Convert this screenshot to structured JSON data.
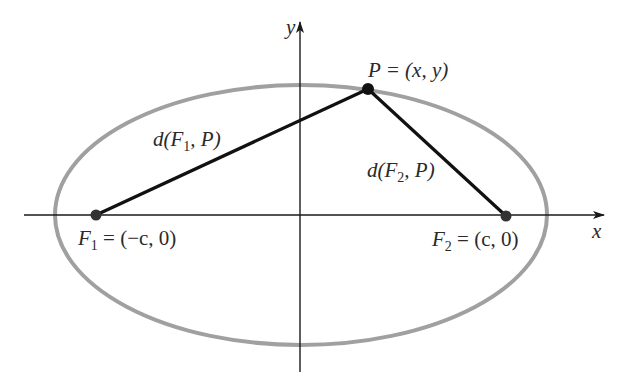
{
  "diagram": {
    "type": "ellipse-foci-distance",
    "colors": {
      "ellipse": "#a0a0a0",
      "axes": "#1a1a1a",
      "segments": "#111111",
      "points": "#333333",
      "text": "#2a2a2a",
      "background": "#ffffff"
    },
    "axes": {
      "x_label": "x",
      "y_label": "y"
    },
    "ellipse": {
      "cx": 301,
      "cy": 215,
      "rx": 246,
      "ry": 130
    },
    "points": {
      "F1": {
        "x": 96,
        "y": 215,
        "label_name": "F",
        "label_sub": "1",
        "label_rest": " = (−c, 0)"
      },
      "F2": {
        "x": 506,
        "y": 216,
        "label_name": "F",
        "label_sub": "2",
        "label_rest": " = (c, 0)"
      },
      "P": {
        "x": 368,
        "y": 89,
        "label": "P = (x, y)"
      }
    },
    "segments": {
      "d1": {
        "label_pre": "d(F",
        "label_sub": "1",
        "label_post": ", P)"
      },
      "d2": {
        "label_pre": "d(F",
        "label_sub": "2",
        "label_post": ", P)"
      }
    }
  }
}
